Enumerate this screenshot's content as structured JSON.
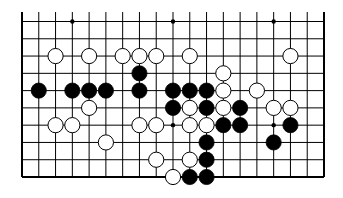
{
  "game": {
    "type": "go",
    "board_section": "bottom portion of a 19x19 board (10 rows visible, top cut off)",
    "columns": 19,
    "visible_rows": 10,
    "edges": {
      "left": true,
      "right": true,
      "bottom": true,
      "top": false
    },
    "star_points": [
      [
        0,
        3
      ],
      [
        0,
        9
      ],
      [
        0,
        15
      ],
      [
        6,
        9
      ],
      [
        6,
        15
      ]
    ],
    "colors": {
      "black": "#000000",
      "white": "#ffffff",
      "line": "#000000",
      "background": "#ffffff"
    },
    "stones": [
      {
        "row": 2,
        "col": 2,
        "color": "white"
      },
      {
        "row": 2,
        "col": 4,
        "color": "white"
      },
      {
        "row": 2,
        "col": 6,
        "color": "white"
      },
      {
        "row": 2,
        "col": 7,
        "color": "white"
      },
      {
        "row": 2,
        "col": 8,
        "color": "white"
      },
      {
        "row": 2,
        "col": 10,
        "color": "white"
      },
      {
        "row": 2,
        "col": 16,
        "color": "white"
      },
      {
        "row": 3,
        "col": 7,
        "color": "black"
      },
      {
        "row": 3,
        "col": 12,
        "color": "white"
      },
      {
        "row": 4,
        "col": 1,
        "color": "black"
      },
      {
        "row": 4,
        "col": 3,
        "color": "black"
      },
      {
        "row": 4,
        "col": 4,
        "color": "black"
      },
      {
        "row": 4,
        "col": 5,
        "color": "black"
      },
      {
        "row": 4,
        "col": 7,
        "color": "black"
      },
      {
        "row": 4,
        "col": 9,
        "color": "black"
      },
      {
        "row": 4,
        "col": 10,
        "color": "black"
      },
      {
        "row": 4,
        "col": 11,
        "color": "black"
      },
      {
        "row": 4,
        "col": 12,
        "color": "white"
      },
      {
        "row": 4,
        "col": 14,
        "color": "white"
      },
      {
        "row": 5,
        "col": 4,
        "color": "white"
      },
      {
        "row": 5,
        "col": 9,
        "color": "black"
      },
      {
        "row": 5,
        "col": 10,
        "color": "white"
      },
      {
        "row": 5,
        "col": 11,
        "color": "black"
      },
      {
        "row": 5,
        "col": 12,
        "color": "white"
      },
      {
        "row": 5,
        "col": 13,
        "color": "black"
      },
      {
        "row": 5,
        "col": 15,
        "color": "white"
      },
      {
        "row": 5,
        "col": 16,
        "color": "white"
      },
      {
        "row": 6,
        "col": 2,
        "color": "white"
      },
      {
        "row": 6,
        "col": 3,
        "color": "white"
      },
      {
        "row": 6,
        "col": 7,
        "color": "white"
      },
      {
        "row": 6,
        "col": 8,
        "color": "white"
      },
      {
        "row": 6,
        "col": 10,
        "color": "white"
      },
      {
        "row": 6,
        "col": 11,
        "color": "white"
      },
      {
        "row": 6,
        "col": 12,
        "color": "black"
      },
      {
        "row": 6,
        "col": 13,
        "color": "black"
      },
      {
        "row": 6,
        "col": 16,
        "color": "black"
      },
      {
        "row": 7,
        "col": 5,
        "color": "white"
      },
      {
        "row": 7,
        "col": 11,
        "color": "black"
      },
      {
        "row": 7,
        "col": 15,
        "color": "black"
      },
      {
        "row": 8,
        "col": 8,
        "color": "white"
      },
      {
        "row": 8,
        "col": 10,
        "color": "white"
      },
      {
        "row": 8,
        "col": 11,
        "color": "black"
      },
      {
        "row": 9,
        "col": 9,
        "color": "white"
      },
      {
        "row": 9,
        "col": 10,
        "color": "black"
      },
      {
        "row": 9,
        "col": 11,
        "color": "black"
      }
    ]
  }
}
